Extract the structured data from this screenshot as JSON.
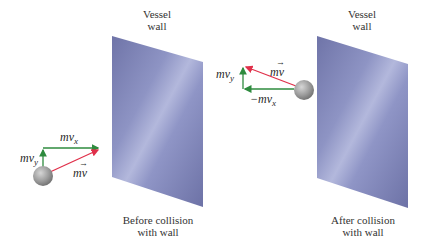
{
  "before": {
    "wall_label_line1": "Vessel",
    "wall_label_line2": "wall",
    "caption_line1": "Before collision",
    "caption_line2": "with wall",
    "vectors": {
      "horizontal": {
        "base": "mv",
        "sub": "x"
      },
      "vertical": {
        "base": "mv",
        "sub": "y"
      },
      "resultant": {
        "base": "mv",
        "arrow": "→"
      }
    }
  },
  "after": {
    "wall_label_line1": "Vessel",
    "wall_label_line2": "wall",
    "caption_line1": "After collision",
    "caption_line2": "with wall",
    "vectors": {
      "horizontal": {
        "base": "−mv",
        "sub": "x"
      },
      "vertical": {
        "base": "mv",
        "sub": "y"
      },
      "resultant": {
        "base": "mv",
        "arrow": "→"
      }
    }
  },
  "colors": {
    "component_vector": "#2e8b3e",
    "resultant_vector": "#e0304a",
    "wall": "#7f86b8",
    "ball": "#9a9a9a"
  }
}
